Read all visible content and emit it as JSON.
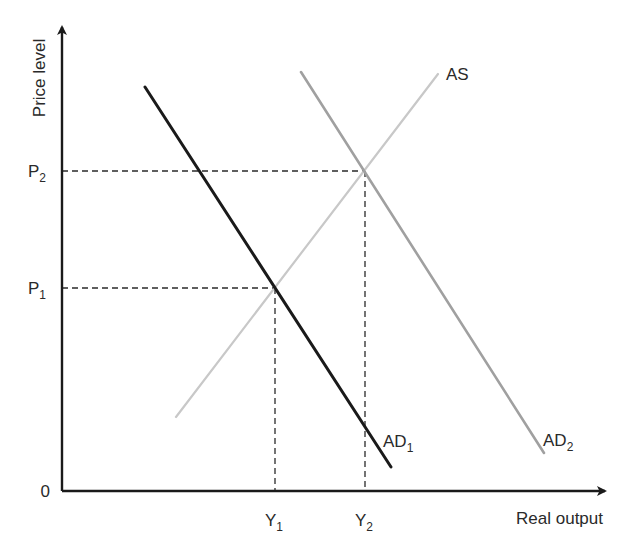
{
  "chart_data": {
    "type": "line",
    "title": "",
    "xlabel": "Real output",
    "ylabel": "Price level",
    "origin_label": "0",
    "grid": false,
    "legend": "inline labels",
    "x_ticks": [
      {
        "label": "Y",
        "sub": "1",
        "px": 275
      },
      {
        "label": "Y",
        "sub": "2",
        "px": 365
      }
    ],
    "y_ticks": [
      {
        "label": "P",
        "sub": "1",
        "py": 288
      },
      {
        "label": "P",
        "sub": "2",
        "py": 171
      }
    ],
    "series": [
      {
        "name": "AS",
        "label": "AS",
        "label_sub": "",
        "color": "#c8c8c8",
        "width": 2.2,
        "points": [
          [
            176,
            417
          ],
          [
            438,
            74
          ]
        ],
        "label_pos": [
          446,
          80
        ]
      },
      {
        "name": "AD1",
        "label": "AD",
        "label_sub": "1",
        "color": "#1a1a1a",
        "width": 3,
        "points": [
          [
            145,
            87
          ],
          [
            391,
            467
          ]
        ],
        "label_pos": [
          383,
          447
        ]
      },
      {
        "name": "AD2",
        "label": "AD",
        "label_sub": "2",
        "color": "#a0a0a0",
        "width": 2.6,
        "points": [
          [
            301,
            72
          ],
          [
            544,
            453
          ]
        ],
        "label_pos": [
          543,
          446
        ]
      }
    ],
    "equilibria": [
      {
        "name": "E1",
        "x_label": "Y1",
        "y_label": "P1",
        "px": 275,
        "py": 288
      },
      {
        "name": "E2",
        "x_label": "Y2",
        "y_label": "P2",
        "px": 365,
        "py": 171
      }
    ],
    "axes": {
      "origin_px": [
        62,
        491
      ],
      "x_end_px": 605,
      "y_end_px": 27,
      "color": "#1a1a1a"
    }
  }
}
